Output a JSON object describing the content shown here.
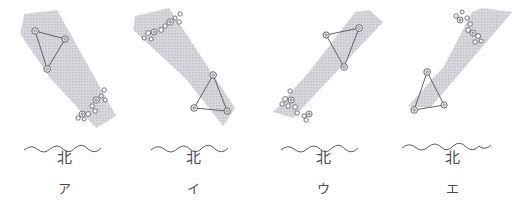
{
  "figure": {
    "title": "",
    "panel_count": 4,
    "colors": {
      "ink": "#5b5b63",
      "milkyway_fill": "#c9c9cf",
      "milkyway_dots": "#9a9aa4",
      "star_stroke": "#54545c",
      "star_fill": "#ffffff",
      "horizon": "#5b5b63",
      "background": "#ffffff"
    },
    "common": {
      "direction_label": "北",
      "milkyway_name": "天の川",
      "triangle_name": "夏の大三角",
      "chain_name": "星の並び"
    }
  },
  "panels": [
    {
      "key": "ア",
      "direction_label": "北",
      "milkyway": {
        "orientation": "upper-left to lower-right",
        "points": "24,14 57,10 116,116 96,128 50,78 20,34"
      },
      "triangle": {
        "stars": [
          {
            "name": "star-a",
            "x": 35,
            "y": 31
          },
          {
            "name": "star-b",
            "x": 65,
            "y": 39
          },
          {
            "name": "star-c",
            "x": 47,
            "y": 69
          }
        ]
      },
      "chain": {
        "stars": [
          {
            "x": 104,
            "y": 90,
            "r": 2.2
          },
          {
            "x": 101,
            "y": 96,
            "r": 2.0
          },
          {
            "x": 105,
            "y": 100,
            "r": 2.0
          },
          {
            "x": 96,
            "y": 100,
            "r": 3.2
          },
          {
            "x": 92,
            "y": 106,
            "r": 2.2
          },
          {
            "x": 95,
            "y": 111,
            "r": 2.2
          },
          {
            "x": 88,
            "y": 114,
            "r": 2.4
          },
          {
            "x": 82,
            "y": 114,
            "r": 3.0
          },
          {
            "x": 78,
            "y": 118,
            "r": 2.2
          },
          {
            "x": 84,
            "y": 119,
            "r": 2.0
          }
        ]
      },
      "horizon": {
        "path": "M26,150 q7,-6 13,-1 q7,6 13,0 q7,-6 13,0 q6,6 12,-1 q7,-6 13,1 q7,6 13,-1"
      }
    },
    {
      "key": "イ",
      "direction_label": "北",
      "milkyway": {
        "orientation": "upper-left to lower-right",
        "points": "6,16 40,8 106,108 94,126 56,78 4,30"
      },
      "triangle": {
        "stars": [
          {
            "name": "star-a",
            "x": 84,
            "y": 75
          },
          {
            "name": "star-b",
            "x": 65,
            "y": 108
          },
          {
            "name": "star-c",
            "x": 98,
            "y": 111
          }
        ]
      },
      "chain": {
        "stars": [
          {
            "x": 51,
            "y": 14,
            "r": 2.2
          },
          {
            "x": 46,
            "y": 18,
            "r": 2.0
          },
          {
            "x": 50,
            "y": 22,
            "r": 2.2
          },
          {
            "x": 41,
            "y": 22,
            "r": 3.2
          },
          {
            "x": 36,
            "y": 26,
            "r": 2.2
          },
          {
            "x": 32,
            "y": 30,
            "r": 2.4
          },
          {
            "x": 25,
            "y": 32,
            "r": 3.0
          },
          {
            "x": 19,
            "y": 33,
            "r": 2.4
          },
          {
            "x": 22,
            "y": 39,
            "r": 2.0
          },
          {
            "x": 15,
            "y": 38,
            "r": 2.0
          }
        ]
      },
      "horizon": {
        "path": "M24,150 q7,-6 13,-1 q7,6 13,0 q7,-6 13,0 q6,6 12,-1 q7,-6 13,1 q7,6 13,-1"
      }
    },
    {
      "key": "ウ",
      "direction_label": "北",
      "milkyway": {
        "orientation": "lower-left to upper-right",
        "points": "110,10 124,22 34,118 14,112 50,72 96,12"
      },
      "triangle": {
        "stars": [
          {
            "name": "star-a",
            "x": 67,
            "y": 35
          },
          {
            "name": "star-b",
            "x": 100,
            "y": 28
          },
          {
            "name": "star-c",
            "x": 85,
            "y": 67
          }
        ]
      },
      "chain": {
        "stars": [
          {
            "x": 31,
            "y": 91,
            "r": 2.2
          },
          {
            "x": 26,
            "y": 99,
            "r": 2.4
          },
          {
            "x": 32,
            "y": 100,
            "r": 3.0
          },
          {
            "x": 23,
            "y": 104,
            "r": 2.2
          },
          {
            "x": 29,
            "y": 106,
            "r": 2.2
          },
          {
            "x": 36,
            "y": 107,
            "r": 2.4
          },
          {
            "x": 38,
            "y": 113,
            "r": 2.2
          },
          {
            "x": 45,
            "y": 116,
            "r": 2.2
          },
          {
            "x": 50,
            "y": 114,
            "r": 3.0
          },
          {
            "x": 47,
            "y": 120,
            "r": 2.2
          }
        ]
      },
      "horizon": {
        "path": "M24,150 q7,-6 13,-1 q7,6 13,0 q7,-6 13,0 q6,6 12,-1 q7,-6 13,1 q7,6 13,-1"
      }
    },
    {
      "key": "エ",
      "direction_label": "北",
      "milkyway": {
        "orientation": "lower-left to upper-right",
        "points": "94,8 124,12 42,108 20,106 56,66 84,12"
      },
      "triangle": {
        "stars": [
          {
            "name": "star-a",
            "x": 39,
            "y": 72
          },
          {
            "name": "star-b",
            "x": 26,
            "y": 110
          },
          {
            "name": "star-c",
            "x": 56,
            "y": 105
          }
        ]
      },
      "chain": {
        "stars": [
          {
            "x": 68,
            "y": 16,
            "r": 2.2
          },
          {
            "x": 74,
            "y": 12,
            "r": 2.0
          },
          {
            "x": 72,
            "y": 20,
            "r": 3.0
          },
          {
            "x": 79,
            "y": 18,
            "r": 2.2
          },
          {
            "x": 82,
            "y": 24,
            "r": 2.2
          },
          {
            "x": 80,
            "y": 30,
            "r": 2.4
          },
          {
            "x": 85,
            "y": 33,
            "r": 3.0
          },
          {
            "x": 90,
            "y": 36,
            "r": 2.4
          },
          {
            "x": 87,
            "y": 42,
            "r": 2.2
          },
          {
            "x": 93,
            "y": 41,
            "r": 2.0
          }
        ]
      },
      "horizon": {
        "path": "M22,146 q7,-6 13,-1 q7,6 13,0 q7,-6 13,0 q6,6 12,-1 q7,-6 13,1 q7,6 13,-1"
      }
    }
  ]
}
